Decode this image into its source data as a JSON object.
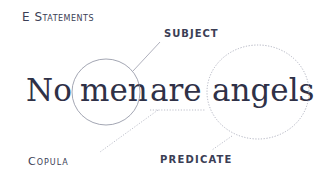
{
  "title": "E Statements",
  "labels": {
    "subject": "SUBJECT",
    "copula": "Copula",
    "predicate": "PREDICATE"
  },
  "sentence": {
    "words": [
      "No",
      "men",
      "are",
      "angels"
    ]
  },
  "colors": {
    "text": "#2f3147",
    "label": "#3b3e55",
    "line": "#9a9cab",
    "dotted": "#b6b8c4"
  }
}
